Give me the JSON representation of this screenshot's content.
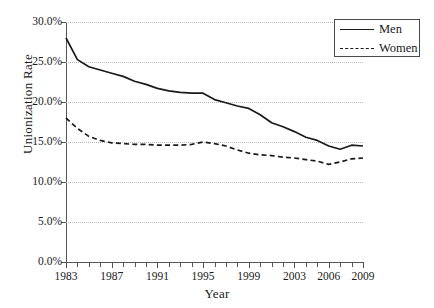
{
  "chart_data": {
    "type": "line",
    "title": "",
    "xlabel": "Year",
    "ylabel": "Unionization Rate",
    "xlim": [
      1983,
      2009
    ],
    "ylim": [
      0,
      30
    ],
    "grid": true,
    "legend_position": "top-right",
    "x": [
      1983,
      1984,
      1985,
      1986,
      1987,
      1988,
      1989,
      1990,
      1991,
      1992,
      1993,
      1994,
      1995,
      1996,
      1997,
      1998,
      1999,
      2000,
      2001,
      2002,
      2003,
      2004,
      2005,
      2006,
      2007,
      2008,
      2009
    ],
    "xtick_labels": [
      "1983",
      "1987",
      "1991",
      "1995",
      "1999",
      "2003",
      "2006",
      "2009"
    ],
    "xtick_values": [
      1983,
      1987,
      1991,
      1995,
      1999,
      2003,
      2006,
      2009
    ],
    "ytick_labels": [
      "0.0%",
      "5.0%",
      "10.0%",
      "15.0%",
      "20.0%",
      "25.0%",
      "30.0%"
    ],
    "ytick_values": [
      0,
      5,
      10,
      15,
      20,
      25,
      30
    ],
    "series": [
      {
        "name": "Men",
        "style": "solid",
        "color": "#1a1a1a",
        "values": [
          28.0,
          25.3,
          24.4,
          24.0,
          23.6,
          23.2,
          22.6,
          22.2,
          21.7,
          21.4,
          21.2,
          21.1,
          21.1,
          20.3,
          19.9,
          19.5,
          19.2,
          18.4,
          17.4,
          16.9,
          16.3,
          15.6,
          15.2,
          14.5,
          14.1,
          14.6,
          14.5
        ]
      },
      {
        "name": "Women",
        "style": "dashed",
        "color": "#1a1a1a",
        "values": [
          18.0,
          16.7,
          15.7,
          15.2,
          14.9,
          14.8,
          14.7,
          14.7,
          14.6,
          14.6,
          14.6,
          14.7,
          15.0,
          14.8,
          14.5,
          14.0,
          13.6,
          13.4,
          13.3,
          13.1,
          13.0,
          12.8,
          12.6,
          12.2,
          12.5,
          12.9,
          13.0
        ]
      }
    ]
  },
  "legend": {
    "entries": [
      {
        "label": "Men"
      },
      {
        "label": "Women"
      }
    ]
  }
}
